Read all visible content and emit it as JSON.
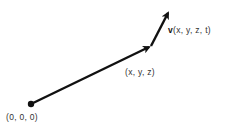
{
  "diagram": {
    "type": "vector-diagram",
    "origin": {
      "label": "(0, 0, 0)",
      "point": [
        31,
        104
      ]
    },
    "position_vector": {
      "from": [
        31,
        104
      ],
      "to": [
        151,
        46
      ],
      "label": "(x, y, z)"
    },
    "velocity_vector": {
      "from": [
        151,
        46
      ],
      "to": [
        170,
        10
      ],
      "label_bold": "v",
      "label_rest": "(x, y, z, t)"
    },
    "colors": {
      "stroke": "#111111",
      "text": "#333333",
      "background": "#ffffff"
    }
  }
}
